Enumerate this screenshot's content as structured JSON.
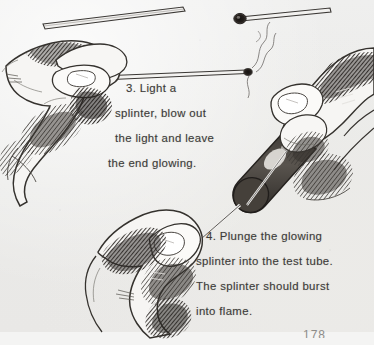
{
  "page": {
    "page_number": "178",
    "background_color": "#ececeb",
    "ink_color": "#3c3b39"
  },
  "captions": [
    {
      "id": "caption-3",
      "number": "3.",
      "lines": [
        "3.  Light a",
        "splinter, blow out",
        "the light and leave",
        "the end glowing."
      ]
    },
    {
      "id": "caption-4",
      "number": "4.",
      "lines": [
        "4.  Plunge the glowing",
        "splinter into the test tube.",
        "The splinter should burst",
        "into flame."
      ]
    }
  ],
  "figures": {
    "splinter_plain": "wooden-splinter",
    "splinter_glowing": "glowing-splinter",
    "hand_left_top": "hand-holding-splinter",
    "hand_right_top": "hand-holding-test-tube",
    "hand_bottom": "hand-plunging-splinter",
    "test_tube": "test-tube",
    "smoke": "smoke-wisp"
  }
}
